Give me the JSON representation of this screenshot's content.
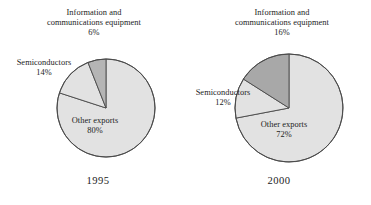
{
  "chart_data": [
    {
      "type": "pie",
      "title": "1995",
      "year_label": "1995",
      "categories": [
        "Information and communications equipment",
        "Semiconductors",
        "Other exports"
      ],
      "values": [
        6,
        14,
        80
      ],
      "value_labels": [
        "6%",
        "14%",
        "80%"
      ],
      "slice_colors": [
        "#b5b5b5",
        "#e2e2e2",
        "#e2e2e2"
      ],
      "start_angle_deg": 90,
      "direction": "counterclockwise",
      "legend": "none",
      "grid": false,
      "labels": {
        "ict_name_line1": "Information and",
        "ict_name_line2": "communications equipment",
        "ict_pct": "6%",
        "semi_name": "Semiconductors",
        "semi_pct": "14%",
        "other_name": "Other exports",
        "other_pct": "80%"
      }
    },
    {
      "type": "pie",
      "title": "2000",
      "year_label": "2000",
      "categories": [
        "Information and communications equipment",
        "Semiconductors",
        "Other exports"
      ],
      "values": [
        16,
        12,
        72
      ],
      "value_labels": [
        "16%",
        "12%",
        "72%"
      ],
      "slice_colors": [
        "#a8a8a8",
        "#e2e2e2",
        "#e2e2e2"
      ],
      "start_angle_deg": 90,
      "direction": "counterclockwise",
      "legend": "none",
      "grid": false,
      "labels": {
        "ict_name_line1": "Information and",
        "ict_name_line2": "communications equipment",
        "ict_pct": "16%",
        "semi_name": "Semiconductors",
        "semi_pct": "12%",
        "other_name": "Other exports",
        "other_pct": "72%"
      }
    }
  ],
  "colors": {
    "outline": "#4a4a4a",
    "slice_dark_1995": "#b5b5b5",
    "slice_dark_2000": "#a8a8a8",
    "slice_light": "#e2e2e2",
    "text": "#1c1c1c",
    "background": "#ffffff"
  }
}
